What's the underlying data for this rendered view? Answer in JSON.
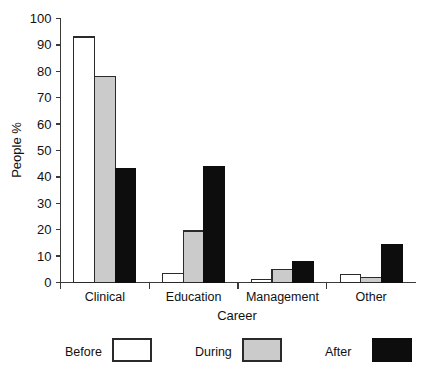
{
  "chart_data": {
    "type": "bar",
    "title": "",
    "xlabel": "Career",
    "ylabel": "People %",
    "categories": [
      "Clinical",
      "Education",
      "Management",
      "Other"
    ],
    "series": [
      {
        "name": "Before",
        "color": "#ffffff",
        "values": [
          93,
          3.5,
          1,
          3
        ]
      },
      {
        "name": "During",
        "color": "#cbcbcb",
        "values": [
          78,
          19.5,
          5,
          2
        ]
      },
      {
        "name": "After",
        "color": "#0d0d0d",
        "values": [
          43,
          44,
          8,
          14.5
        ]
      }
    ],
    "ylim": [
      0,
      100
    ],
    "yticks": [
      0,
      10,
      20,
      30,
      40,
      50,
      60,
      70,
      80,
      90,
      100
    ],
    "ytick_labels": [
      "0",
      "10",
      "20",
      "30",
      "40",
      "50",
      "60",
      "70",
      "80",
      "90",
      "100"
    ],
    "grid": false,
    "legend_position": "bottom",
    "legend_entries": [
      "Before",
      "During",
      "After"
    ]
  }
}
